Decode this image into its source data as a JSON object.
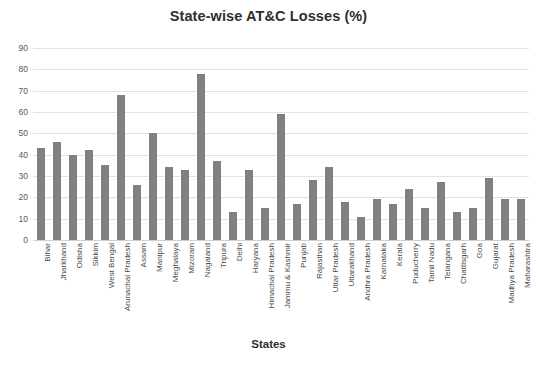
{
  "chart_data": {
    "type": "bar",
    "title": "State-wise AT&C Losses (%)",
    "xlabel": "States",
    "ylabel": "",
    "ylim": [
      0,
      90
    ],
    "ytick_step": 10,
    "yticks": [
      0,
      10,
      20,
      30,
      40,
      50,
      60,
      70,
      80,
      90
    ],
    "grid": true,
    "legend": false,
    "bar_color": "#808080",
    "categories": [
      "Bihar",
      "Jharkhand",
      "Odisha",
      "Sikkim",
      "West Bengal",
      "Arunachal Pradesh",
      "Assam",
      "Manipur",
      "Meghalaya",
      "Mizoram",
      "Nagaland",
      "Tripura",
      "Delhi",
      "Haryana",
      "Himachal Pradesh",
      "Jammu & Kashmir",
      "Punjab",
      "Rajasthan",
      "Uttar Pradesh",
      "Uttarakhand",
      "Andhra Pradesh",
      "Karnataka",
      "Kerala",
      "Puducherry",
      "Tamil Nadu",
      "Telangana",
      "Chattisgarh",
      "Goa",
      "Gujarat",
      "Madhya Pradesh",
      "Maharashtra"
    ],
    "values": [
      43,
      46,
      40,
      42,
      35,
      68,
      26,
      50,
      34,
      33,
      78,
      37,
      13,
      33,
      15,
      59,
      17,
      28,
      34,
      18,
      11,
      19,
      17,
      24,
      15,
      27,
      13,
      15,
      29,
      19,
      19
    ]
  }
}
